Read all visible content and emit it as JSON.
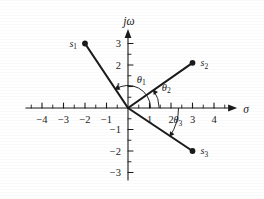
{
  "figure": {
    "kind": "s-plane-pole-vector-diagram",
    "background": "#ffffff",
    "ink": "#1a1a1a"
  },
  "axes": {
    "x_label": "σ",
    "y_label": "jω",
    "x_ticks": [
      -4,
      -3,
      -2,
      -1,
      1,
      2,
      3,
      4
    ],
    "x_tick_labels": [
      "−4",
      "−3",
      "−2",
      "−1",
      "1",
      "2",
      "3",
      "4"
    ],
    "y_ticks": [
      -3,
      -2,
      -1,
      1,
      2,
      3
    ],
    "y_tick_labels": [
      "−3",
      "−2",
      "−1",
      "1",
      "2",
      "3"
    ],
    "xlim": [
      -4.75,
      4.75
    ],
    "ylim": [
      -3.35,
      3.35
    ],
    "minor_ticks": true,
    "grid": false
  },
  "chart_data": {
    "type": "scatter",
    "title": "",
    "xlabel": "σ",
    "ylabel": "jω",
    "xlim": [
      -4.75,
      4.75
    ],
    "ylim": [
      -3.35,
      3.35
    ],
    "grid": false,
    "legend": "none",
    "points": [
      {
        "name": "s1",
        "label": "s₁",
        "label_text": "s",
        "sub": "1",
        "x": -2.0,
        "y": 3.0,
        "label_side": "left"
      },
      {
        "name": "s2",
        "label": "s₂",
        "label_text": "s",
        "sub": "2",
        "x": 3.0,
        "y": 2.1,
        "label_side": "right"
      },
      {
        "name": "s3",
        "label": "s₃",
        "label_text": "s",
        "sub": "3",
        "x": 3.0,
        "y": -2.0,
        "label_side": "right"
      }
    ],
    "vectors": [
      {
        "name": "vector-s1",
        "from": [
          0,
          0
        ],
        "to": [
          -2.0,
          3.0
        ]
      },
      {
        "name": "vector-s2",
        "from": [
          0,
          0
        ],
        "to": [
          3.0,
          2.1
        ]
      },
      {
        "name": "vector-s3",
        "from": [
          0,
          0
        ],
        "to": [
          3.0,
          -2.0
        ]
      }
    ],
    "angles": [
      {
        "name": "theta1",
        "label_text": "θ",
        "sub": "1",
        "label": "θ₁",
        "from_deg": 0,
        "to_deg": 123.7,
        "radius": 1.05,
        "sweep": "ccw",
        "label_x": 0.62,
        "label_y": 1.18
      },
      {
        "name": "theta2",
        "label_text": "θ",
        "sub": "2",
        "label": "θ₂",
        "from_deg": 0,
        "to_deg": 35.0,
        "radius": 1.45,
        "sweep": "ccw",
        "label_x": 1.78,
        "label_y": 0.8
      },
      {
        "name": "theta3",
        "label_text": "θ",
        "sub": "3",
        "label": "θ₃",
        "from_deg": 0,
        "to_deg": -33.7,
        "radius": 2.35,
        "sweep": "cw",
        "label_x": 2.32,
        "label_y": -0.72
      }
    ]
  }
}
